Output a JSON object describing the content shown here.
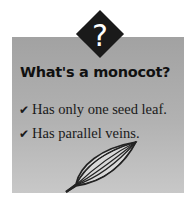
{
  "badge": {
    "icon": "question-mark-icon",
    "symbol": "?"
  },
  "card": {
    "title": "What's a monocot?",
    "items": [
      {
        "icon": "checkmark-icon",
        "check": "✔",
        "text": "Has only one seed leaf."
      },
      {
        "icon": "checkmark-icon",
        "check": "✔",
        "text": "Has parallel veins."
      }
    ],
    "illustration": "monocot-leaf-icon"
  },
  "colors": {
    "card_bg": "#a8a8a8",
    "diamond": "#1a1a1a",
    "text": "#111111"
  }
}
